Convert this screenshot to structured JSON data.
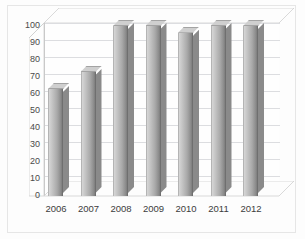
{
  "chart_data": {
    "type": "bar",
    "title": "",
    "subtitle": "",
    "xlabel": "",
    "ylabel": "",
    "categories": [
      "2006",
      "2007",
      "2008",
      "2009",
      "2010",
      "2011",
      "2012"
    ],
    "values": [
      63,
      73,
      100,
      100,
      96,
      100,
      100
    ],
    "ylim": [
      0,
      100
    ],
    "ytick_labels": [
      "100",
      "90",
      "80",
      "70",
      "60",
      "50",
      "40",
      "30",
      "20",
      "10",
      "0"
    ],
    "ytick_values": [
      100,
      90,
      80,
      70,
      60,
      50,
      40,
      30,
      20,
      10,
      0
    ],
    "ytick_step": 10,
    "grid": true,
    "grid_orientation": "horizontal",
    "legend": null,
    "legend_position": "none",
    "annotations": [],
    "style": "3d-column",
    "series": [
      {
        "name": "Series 1",
        "values": [
          63,
          73,
          100,
          100,
          96,
          100,
          100
        ]
      }
    ],
    "colors": {
      "bar_light": "#d6d6d6",
      "bar_mid": "#a9a9a9",
      "bar_dark": "#7d7d7d",
      "gridline": "#dcdde0",
      "axis": "#c9c9c9",
      "label_text": "#4a4a4a",
      "plot_background": "#fefefe",
      "frame_border": "#e6e6e6"
    }
  }
}
